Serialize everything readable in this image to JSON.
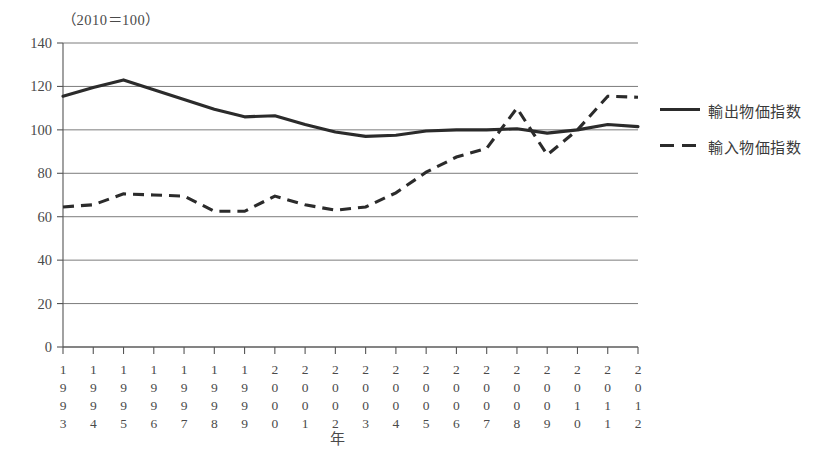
{
  "chart_data": {
    "type": "line",
    "title": "",
    "unit_note": "（2010＝100）",
    "xlabel": "年",
    "ylabel": "",
    "categories": [
      "1993",
      "1994",
      "1995",
      "1996",
      "1997",
      "1998",
      "1999",
      "2000",
      "2001",
      "2002",
      "2003",
      "2004",
      "2005",
      "2006",
      "2007",
      "2008",
      "2009",
      "2010",
      "2011",
      "2012"
    ],
    "ylim": [
      0,
      140
    ],
    "ytick_labels": [
      "140",
      "120",
      "100",
      "80",
      "60",
      "40",
      "20",
      "0"
    ],
    "ytick_values": [
      140,
      120,
      100,
      80,
      60,
      40,
      20,
      0
    ],
    "grid": true,
    "legend_position": "right",
    "series": [
      {
        "name": "輸出物価指数",
        "style": "solid",
        "color": "#2b2b2b",
        "values": [
          115.5,
          119.5,
          123.0,
          118.5,
          114.0,
          109.5,
          106.0,
          106.5,
          102.5,
          99.0,
          97.0,
          97.5,
          99.5,
          100.0,
          100.0,
          100.5,
          98.5,
          100.0,
          102.5,
          101.5
        ]
      },
      {
        "name": "輸入物価指数",
        "style": "dashed",
        "color": "#2b2b2b",
        "values": [
          64.5,
          65.5,
          70.5,
          70.0,
          69.5,
          62.5,
          62.5,
          69.5,
          65.5,
          63.0,
          64.5,
          71.0,
          80.5,
          87.5,
          91.5,
          110.0,
          88.5,
          100.0,
          115.5,
          115.0
        ]
      }
    ]
  }
}
